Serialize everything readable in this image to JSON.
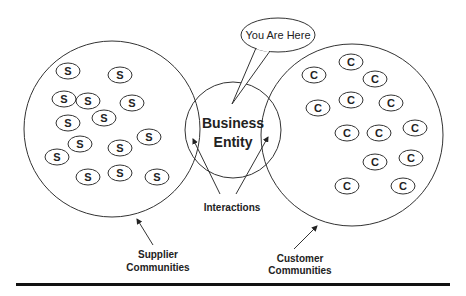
{
  "diagram": {
    "type": "venn-like ecosystem diagram",
    "colors": {
      "stroke": "#333333",
      "text": "#222222",
      "background": "#ffffff",
      "rule": "#111111"
    },
    "callout": {
      "text": "You Are Here",
      "cx": 278,
      "cy": 35,
      "rx": 37,
      "ry": 17
    },
    "center": {
      "title_line1": "Business",
      "title_line2": "Entity",
      "cx": 233,
      "cy": 130,
      "r": 48
    },
    "supplier_group": {
      "label_line1": "Supplier",
      "label_line2": "Communities",
      "cx": 112,
      "cy": 129,
      "r": 88,
      "member_letter": "S",
      "members": [
        {
          "x": 68,
          "y": 71
        },
        {
          "x": 120,
          "y": 75
        },
        {
          "x": 64,
          "y": 99
        },
        {
          "x": 88,
          "y": 101
        },
        {
          "x": 132,
          "y": 103
        },
        {
          "x": 68,
          "y": 123
        },
        {
          "x": 104,
          "y": 118
        },
        {
          "x": 80,
          "y": 144
        },
        {
          "x": 57,
          "y": 157
        },
        {
          "x": 149,
          "y": 137
        },
        {
          "x": 120,
          "y": 148
        },
        {
          "x": 88,
          "y": 177
        },
        {
          "x": 120,
          "y": 173
        },
        {
          "x": 157,
          "y": 177
        }
      ]
    },
    "customer_group": {
      "label_line1": "Customer",
      "label_line2": "Communities",
      "cx": 352,
      "cy": 135,
      "r": 91,
      "member_letter": "C",
      "members": [
        {
          "x": 314,
          "y": 75
        },
        {
          "x": 351,
          "y": 62
        },
        {
          "x": 375,
          "y": 79
        },
        {
          "x": 318,
          "y": 108
        },
        {
          "x": 351,
          "y": 100
        },
        {
          "x": 391,
          "y": 103
        },
        {
          "x": 347,
          "y": 133
        },
        {
          "x": 379,
          "y": 133
        },
        {
          "x": 415,
          "y": 128
        },
        {
          "x": 375,
          "y": 162
        },
        {
          "x": 411,
          "y": 158
        },
        {
          "x": 347,
          "y": 186
        },
        {
          "x": 403,
          "y": 186
        }
      ]
    },
    "interactions_label": "Interactions"
  }
}
